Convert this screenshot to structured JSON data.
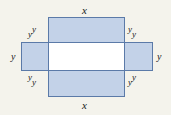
{
  "figure": {
    "type": "geometry-diagram",
    "background_color": "#f4f3ec",
    "shape_fill_color": "#c3d2e8",
    "shape_border_color": "#5b7aa8",
    "overlap_fill_color": "#ffffff",
    "labels": {
      "x_top": "x",
      "x_bottom": "x",
      "y_left": "y",
      "y_right": "y",
      "corner_top_left": {
        "first": "y",
        "second": "y"
      },
      "corner_top_right": {
        "first": "y",
        "second": "y"
      },
      "corner_bottom_left": {
        "first": "y",
        "second": "y"
      },
      "corner_bottom_right": {
        "first": "y",
        "second": "y"
      }
    }
  }
}
